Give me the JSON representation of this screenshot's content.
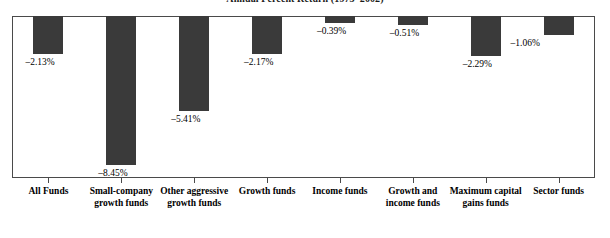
{
  "chart_data": {
    "type": "bar",
    "title": "Annual Percent Return (1973–2002)",
    "xlabel": "",
    "ylabel": "",
    "ylim": [
      -9.2,
      0
    ],
    "grid": false,
    "legend": "none",
    "orientation": "vertical-negative",
    "bar_color": "#3a3a3a",
    "frame_color": "#4a4a4a",
    "categories": [
      "All Funds",
      "Small-company growth funds",
      "Other aggressive growth funds",
      "Growth funds",
      "Income funds",
      "Growth and income funds",
      "Maximum capital gains funds",
      "Sector funds"
    ],
    "values": [
      -2.13,
      -8.45,
      -5.41,
      -2.17,
      -0.39,
      -0.51,
      -2.29,
      -1.06
    ],
    "data_labels": [
      "–2.13%",
      "–8.45%",
      "–5.41%",
      "–2.17%",
      "–0.39%",
      "–0.51%",
      "–2.29%",
      "–1.06%"
    ]
  }
}
